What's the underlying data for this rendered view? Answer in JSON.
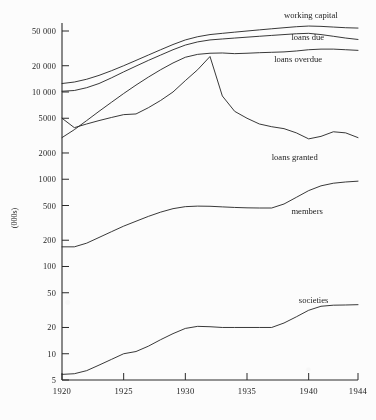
{
  "chart_data": {
    "type": "line",
    "title": "",
    "xlabel": "",
    "ylabel": "(000s)",
    "yscale": "log",
    "ylim": [
      5,
      60000
    ],
    "xlim": [
      1920,
      1944
    ],
    "grid": false,
    "legend": "inline-right-labels",
    "ytick_labels": [
      "5",
      "10",
      "20",
      "50",
      "100",
      "200",
      "500",
      "1000",
      "2000",
      "5000",
      "10 000",
      "20 000",
      "50 000"
    ],
    "ytick_values": [
      5,
      10,
      20,
      50,
      100,
      200,
      500,
      1000,
      2000,
      5000,
      10000,
      20000,
      50000
    ],
    "xtick_labels": [
      "1920",
      "1925",
      "1930",
      "1935",
      "1940",
      "1944"
    ],
    "xtick_values": [
      1920,
      1925,
      1930,
      1935,
      1940,
      1944
    ],
    "series": [
      {
        "name": "working capital",
        "label": "working capital",
        "x": [
          1920,
          1921,
          1922,
          1923,
          1924,
          1925,
          1926,
          1927,
          1928,
          1929,
          1930,
          1931,
          1932,
          1933,
          1934,
          1935,
          1936,
          1937,
          1938,
          1939,
          1940,
          1941,
          1942,
          1943,
          1944
        ],
        "y": [
          12500,
          13000,
          14000,
          15500,
          17500,
          20000,
          23000,
          26500,
          30500,
          35000,
          39500,
          43000,
          45500,
          47000,
          48500,
          50000,
          51500,
          53000,
          54500,
          56000,
          57000,
          56500,
          55500,
          54500,
          54000
        ]
      },
      {
        "name": "loans due",
        "label": "loans due",
        "x": [
          1920,
          1921,
          1922,
          1923,
          1924,
          1925,
          1926,
          1927,
          1928,
          1929,
          1930,
          1931,
          1932,
          1933,
          1934,
          1935,
          1936,
          1937,
          1938,
          1939,
          1940,
          1941,
          1942,
          1943,
          1944
        ],
        "y": [
          10200,
          10400,
          11200,
          12500,
          14500,
          17000,
          19800,
          23000,
          26500,
          30500,
          34500,
          37500,
          39500,
          40500,
          41500,
          42500,
          43500,
          44500,
          45500,
          46500,
          47000,
          45500,
          43500,
          41500,
          40000
        ]
      },
      {
        "name": "loans overdue",
        "label": "loans overdue",
        "x": [
          1920,
          1921,
          1922,
          1923,
          1924,
          1925,
          1926,
          1927,
          1928,
          1929,
          1930,
          1931,
          1932,
          1933,
          1934,
          1935,
          1936,
          1937,
          1938,
          1939,
          1940,
          1941,
          1942,
          1943,
          1944
        ],
        "y": [
          3000,
          3700,
          4700,
          6000,
          7600,
          9600,
          12000,
          14800,
          18000,
          21500,
          25000,
          27000,
          27800,
          28000,
          27500,
          27800,
          28200,
          28500,
          28800,
          29500,
          30500,
          31000,
          31000,
          30500,
          30000
        ]
      },
      {
        "name": "loans granted",
        "label": "loans granted",
        "x": [
          1920,
          1921,
          1922,
          1923,
          1924,
          1925,
          1926,
          1927,
          1928,
          1929,
          1930,
          1931,
          1932,
          1933,
          1934,
          1935,
          1936,
          1937,
          1938,
          1939,
          1940,
          1941,
          1942,
          1943,
          1944
        ],
        "y": [
          5000,
          3900,
          4300,
          4700,
          5100,
          5500,
          5600,
          6600,
          8000,
          10000,
          13500,
          18000,
          25500,
          9000,
          6000,
          5000,
          4300,
          4000,
          3800,
          3400,
          2900,
          3100,
          3500,
          3400,
          3000
        ]
      },
      {
        "name": "members",
        "label": "members",
        "x": [
          1920,
          1921,
          1922,
          1923,
          1924,
          1925,
          1926,
          1927,
          1928,
          1929,
          1930,
          1931,
          1932,
          1933,
          1934,
          1935,
          1936,
          1937,
          1938,
          1939,
          1940,
          1941,
          1942,
          1943,
          1944
        ],
        "y": [
          168,
          168,
          185,
          215,
          250,
          290,
          330,
          375,
          420,
          460,
          485,
          492,
          490,
          482,
          475,
          470,
          468,
          468,
          520,
          620,
          740,
          840,
          900,
          930,
          950
        ]
      },
      {
        "name": "societies",
        "label": "societies",
        "x": [
          1920,
          1921,
          1922,
          1923,
          1924,
          1925,
          1926,
          1927,
          1928,
          1929,
          1930,
          1931,
          1932,
          1933,
          1934,
          1935,
          1936,
          1937,
          1938,
          1939,
          1940,
          1941,
          1942,
          1943,
          1944
        ],
        "y": [
          5.8,
          5.9,
          6.4,
          7.4,
          8.6,
          10.0,
          10.6,
          12.2,
          14.5,
          17.0,
          19.5,
          20.6,
          20.4,
          20.0,
          20.0,
          20.0,
          20.0,
          20.0,
          22.5,
          26.5,
          31.5,
          35.0,
          36.0,
          36.2,
          36.5
        ]
      }
    ],
    "series_labels": [
      {
        "name": "working capital",
        "x": 1938.0,
        "y_px": 18
      },
      {
        "name": "loans due",
        "x": 1938.6,
        "y_px": 40
      },
      {
        "name": "loans overdue",
        "x": 1937.2,
        "y_px": 62
      },
      {
        "name": "loans granted",
        "x": 1937.0,
        "y_px": 160
      },
      {
        "name": "members",
        "x": 1938.6,
        "y_px": 214
      },
      {
        "name": "societies",
        "x": 1939.2,
        "y_px": 303
      }
    ]
  }
}
